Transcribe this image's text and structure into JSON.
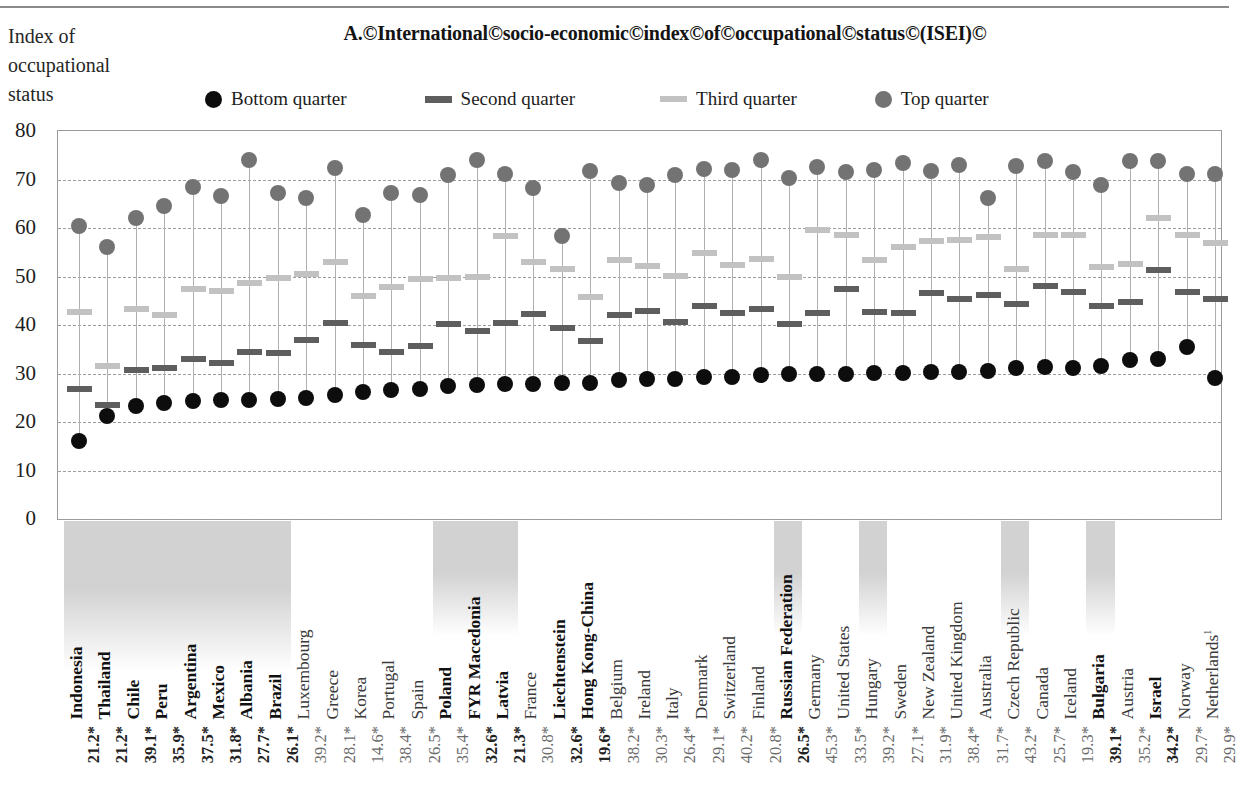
{
  "axis_label": "Index of occupational status",
  "title": "A.©International©socio-economic©index©of©occupational©status©(ISEI)©",
  "legend": [
    {
      "label": "Bottom quarter",
      "marker": "circle",
      "color": "#0d0d0d"
    },
    {
      "label": "Second quarter",
      "marker": "dash",
      "color": "#5e5e5e"
    },
    {
      "label": "Third quarter",
      "marker": "dash",
      "color": "#c2c2c2"
    },
    {
      "label": "Top quarter",
      "marker": "circle",
      "color": "#737373"
    }
  ],
  "colors": {
    "bottom_quarter": "#0d0d0d",
    "second_quarter": "#5e5e5e",
    "third_quarter": "#c2c2c2",
    "top_quarter": "#737373",
    "gridline": "#9d9d9d",
    "stem": "#b0b0b0",
    "shade": "#d2d2d2"
  },
  "chart_data": {
    "type": "scatter",
    "title": "A.©International©socio-economic©index©of©occupational©status©(ISEI)©",
    "ylabel": "Index of occupational status",
    "xlabel": "",
    "ylim": [
      0,
      80
    ],
    "yticks": [
      0,
      10,
      20,
      30,
      40,
      50,
      60,
      70,
      80
    ],
    "grid": true,
    "legend_position": "top",
    "categories": [
      "Indonesia",
      "Thailand",
      "Chile",
      "Peru",
      "Argentina",
      "Mexico",
      "Albania",
      "Brazil",
      "Luxembourg",
      "Greece",
      "Korea",
      "Portugal",
      "Spain",
      "Poland",
      "FYR Macedonia",
      "Latvia",
      "France",
      "Liechtenstein",
      "Hong Kong-China",
      "Belgium",
      "Ireland",
      "Italy",
      "Denmark",
      "Switzerland",
      "Finland",
      "Russian Federation",
      "Germany",
      "United States",
      "Hungary",
      "Sweden",
      "New Zealand",
      "United Kingdom",
      "Australia",
      "Czech Republic",
      "Canada",
      "Iceland",
      "Bulgaria",
      "Austria",
      "Israel",
      "Norway",
      "Netherlands"
    ],
    "category_bold": [
      true,
      true,
      true,
      true,
      true,
      true,
      true,
      true,
      false,
      false,
      false,
      false,
      false,
      true,
      true,
      true,
      false,
      true,
      true,
      false,
      false,
      false,
      false,
      false,
      false,
      true,
      false,
      false,
      false,
      false,
      false,
      false,
      false,
      false,
      false,
      false,
      true,
      false,
      true,
      false,
      false
    ],
    "category_shaded": [
      true,
      true,
      true,
      true,
      true,
      true,
      true,
      true,
      false,
      false,
      false,
      false,
      false,
      true,
      true,
      true,
      false,
      false,
      false,
      false,
      false,
      false,
      false,
      false,
      false,
      true,
      false,
      false,
      true,
      false,
      false,
      false,
      false,
      true,
      false,
      false,
      true,
      false,
      false,
      false,
      false
    ],
    "category_footnote": {
      "Netherlands": "1"
    },
    "series": [
      {
        "name": "Bottom quarter",
        "marker": "circle",
        "color": "#0d0d0d",
        "values": [
          16.0,
          21.3,
          23.4,
          24.0,
          24.3,
          24.5,
          24.6,
          24.7,
          25.0,
          25.5,
          26.2,
          26.6,
          26.9,
          27.4,
          27.6,
          27.9,
          27.9,
          28.0,
          28.0,
          28.6,
          28.8,
          28.9,
          29.2,
          29.2,
          29.6,
          29.8,
          30.0,
          30.0,
          30.2,
          30.2,
          30.3,
          30.4,
          30.6,
          31.2,
          31.3,
          31.2,
          31.5,
          32.7,
          33.0,
          35.4,
          29.0
        ]
      },
      {
        "name": "Second quarter",
        "marker": "dash",
        "color": "#5e5e5e",
        "values": [
          26.9,
          23.6,
          30.7,
          31.1,
          33.0,
          32.2,
          34.5,
          34.2,
          37.0,
          40.4,
          35.8,
          34.5,
          35.7,
          40.2,
          38.8,
          40.4,
          42.2,
          39.3,
          36.8,
          42.0,
          42.8,
          40.6,
          44.0,
          42.4,
          43.4,
          40.3,
          42.5,
          47.4,
          42.7,
          42.5,
          46.7,
          45.4,
          46.2,
          44.4,
          48.0,
          46.9,
          43.9,
          44.8,
          51.3,
          46.8,
          45.3
        ]
      },
      {
        "name": "Third quarter",
        "marker": "dash",
        "color": "#c2c2c2",
        "values": [
          42.6,
          31.6,
          43.2,
          42.0,
          47.4,
          47.0,
          48.7,
          49.6,
          50.5,
          52.9,
          46.0,
          47.8,
          49.5,
          49.7,
          50.0,
          58.4,
          53.0,
          51.6,
          45.7,
          53.5,
          52.2,
          50.2,
          54.8,
          52.3,
          53.6,
          50.0,
          59.5,
          58.6,
          53.5,
          56.0,
          57.4,
          57.6,
          58.2,
          51.5,
          58.6,
          58.6,
          52.0,
          52.5,
          62.0,
          58.5,
          57.0
        ]
      },
      {
        "name": "Top quarter",
        "marker": "circle",
        "color": "#737373",
        "values": [
          60.4,
          56.0,
          62.0,
          64.5,
          68.4,
          66.5,
          74.0,
          67.2,
          66.1,
          72.3,
          62.6,
          67.2,
          66.9,
          71.0,
          74.1,
          71.2,
          68.2,
          58.3,
          71.7,
          69.2,
          68.8,
          70.9,
          72.1,
          71.9,
          74.0,
          70.3,
          72.6,
          71.5,
          71.9,
          73.4,
          71.7,
          73.0,
          66.1,
          72.8,
          73.8,
          71.5,
          68.9,
          73.8,
          73.8,
          71.1,
          71.1
        ]
      }
    ],
    "bottom_values": [
      "21.2*",
      "21.2*",
      "39.1*",
      "35.9*",
      "37.5*",
      "31.8*",
      "27.7*",
      "26.1*",
      "39.2*",
      "28.1*",
      "14.6*",
      "38.4*",
      "26.5*",
      "35.4*",
      "32.6*",
      "21.3*",
      "30.8*",
      "32.6*",
      "19.6*",
      "38.2*",
      "30.3*",
      "26.4*",
      "29.1*",
      "40.2*",
      "20.8*",
      "26.5*",
      "45.3*",
      "33.5*",
      "39.2*",
      "27.1*",
      "31.9*",
      "38.4*",
      "31.7*",
      "43.2*",
      "25.7*",
      "19.3*",
      "39.1*",
      "35.2*",
      "34.2*",
      "29.7*",
      "29.9*"
    ],
    "bottom_values_bold": [
      true,
      true,
      true,
      true,
      true,
      true,
      true,
      true,
      false,
      false,
      false,
      false,
      false,
      false,
      true,
      true,
      false,
      true,
      true,
      false,
      false,
      false,
      false,
      false,
      false,
      true,
      false,
      false,
      false,
      false,
      false,
      false,
      false,
      false,
      false,
      false,
      true,
      false,
      true,
      false,
      false
    ]
  }
}
